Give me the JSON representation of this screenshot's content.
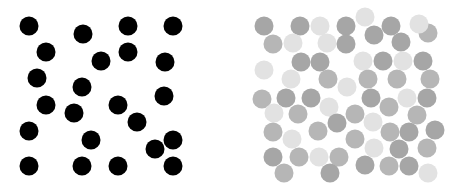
{
  "figure": {
    "width": 461,
    "height": 190,
    "background": "#ffffff",
    "panels": [
      {
        "id": "left",
        "description": "black dots on white",
        "radius": 9.5,
        "dots": [
          {
            "x": 29,
            "y": 26,
            "c": "#000000"
          },
          {
            "x": 83,
            "y": 34,
            "c": "#000000"
          },
          {
            "x": 128,
            "y": 26,
            "c": "#000000"
          },
          {
            "x": 173,
            "y": 26,
            "c": "#000000"
          },
          {
            "x": 46,
            "y": 52,
            "c": "#000000"
          },
          {
            "x": 101,
            "y": 61,
            "c": "#000000"
          },
          {
            "x": 128,
            "y": 52,
            "c": "#000000"
          },
          {
            "x": 165,
            "y": 62,
            "c": "#000000"
          },
          {
            "x": 37,
            "y": 78,
            "c": "#000000"
          },
          {
            "x": 82,
            "y": 87,
            "c": "#000000"
          },
          {
            "x": 164,
            "y": 96,
            "c": "#000000"
          },
          {
            "x": 46,
            "y": 105,
            "c": "#000000"
          },
          {
            "x": 74,
            "y": 113,
            "c": "#000000"
          },
          {
            "x": 118,
            "y": 105,
            "c": "#000000"
          },
          {
            "x": 137,
            "y": 122,
            "c": "#000000"
          },
          {
            "x": 29,
            "y": 131,
            "c": "#000000"
          },
          {
            "x": 91,
            "y": 140,
            "c": "#000000"
          },
          {
            "x": 173,
            "y": 140,
            "c": "#000000"
          },
          {
            "x": 155,
            "y": 149,
            "c": "#000000"
          },
          {
            "x": 29,
            "y": 166,
            "c": "#000000"
          },
          {
            "x": 82,
            "y": 166,
            "c": "#000000"
          },
          {
            "x": 118,
            "y": 166,
            "c": "#000000"
          },
          {
            "x": 173,
            "y": 166,
            "c": "#000000"
          }
        ]
      },
      {
        "id": "right",
        "description": "gray dots of varying lightness on white",
        "radius": 9.5,
        "colors": {
          "dark": "#a6a6a6",
          "mid": "#b6b6b6",
          "light": "#e2e2e2"
        },
        "dots": [
          {
            "x": 34,
            "y": 26,
            "t": "dark"
          },
          {
            "x": 70,
            "y": 26,
            "t": "dark"
          },
          {
            "x": 90,
            "y": 26,
            "t": "light"
          },
          {
            "x": 116,
            "y": 26,
            "t": "dark"
          },
          {
            "x": 135,
            "y": 17,
            "t": "light"
          },
          {
            "x": 161,
            "y": 26,
            "t": "dark"
          },
          {
            "x": 198,
            "y": 33,
            "t": "mid"
          },
          {
            "x": 189,
            "y": 24,
            "t": "light"
          },
          {
            "x": 43,
            "y": 44,
            "t": "mid"
          },
          {
            "x": 63,
            "y": 43,
            "t": "light"
          },
          {
            "x": 97,
            "y": 43,
            "t": "light"
          },
          {
            "x": 116,
            "y": 44,
            "t": "dark"
          },
          {
            "x": 144,
            "y": 35,
            "t": "dark"
          },
          {
            "x": 171,
            "y": 42,
            "t": "dark"
          },
          {
            "x": 34,
            "y": 70,
            "t": "light"
          },
          {
            "x": 71,
            "y": 62,
            "t": "dark"
          },
          {
            "x": 90,
            "y": 62,
            "t": "dark"
          },
          {
            "x": 133,
            "y": 61,
            "t": "light"
          },
          {
            "x": 153,
            "y": 61,
            "t": "dark"
          },
          {
            "x": 173,
            "y": 61,
            "t": "light"
          },
          {
            "x": 193,
            "y": 61,
            "t": "dark"
          },
          {
            "x": 61,
            "y": 79,
            "t": "light"
          },
          {
            "x": 98,
            "y": 79,
            "t": "mid"
          },
          {
            "x": 117,
            "y": 87,
            "t": "light"
          },
          {
            "x": 138,
            "y": 79,
            "t": "mid"
          },
          {
            "x": 167,
            "y": 79,
            "t": "mid"
          },
          {
            "x": 200,
            "y": 79,
            "t": "mid"
          },
          {
            "x": 32,
            "y": 99,
            "t": "mid"
          },
          {
            "x": 56,
            "y": 98,
            "t": "dark"
          },
          {
            "x": 81,
            "y": 98,
            "t": "dark"
          },
          {
            "x": 99,
            "y": 107,
            "t": "light"
          },
          {
            "x": 141,
            "y": 98,
            "t": "dark"
          },
          {
            "x": 159,
            "y": 107,
            "t": "mid"
          },
          {
            "x": 177,
            "y": 98,
            "t": "light"
          },
          {
            "x": 197,
            "y": 98,
            "t": "dark"
          },
          {
            "x": 44,
            "y": 113,
            "t": "light"
          },
          {
            "x": 68,
            "y": 114,
            "t": "mid"
          },
          {
            "x": 107,
            "y": 123,
            "t": "dark"
          },
          {
            "x": 125,
            "y": 114,
            "t": "mid"
          },
          {
            "x": 143,
            "y": 122,
            "t": "light"
          },
          {
            "x": 187,
            "y": 115,
            "t": "mid"
          },
          {
            "x": 43,
            "y": 132,
            "t": "mid"
          },
          {
            "x": 62,
            "y": 139,
            "t": "light"
          },
          {
            "x": 88,
            "y": 131,
            "t": "mid"
          },
          {
            "x": 125,
            "y": 139,
            "t": "mid"
          },
          {
            "x": 160,
            "y": 132,
            "t": "mid"
          },
          {
            "x": 179,
            "y": 132,
            "t": "dark"
          },
          {
            "x": 205,
            "y": 130,
            "t": "dark"
          },
          {
            "x": 43,
            "y": 157,
            "t": "dark"
          },
          {
            "x": 69,
            "y": 157,
            "t": "mid"
          },
          {
            "x": 89,
            "y": 157,
            "t": "light"
          },
          {
            "x": 109,
            "y": 157,
            "t": "mid"
          },
          {
            "x": 144,
            "y": 148,
            "t": "light"
          },
          {
            "x": 169,
            "y": 149,
            "t": "dark"
          },
          {
            "x": 197,
            "y": 148,
            "t": "mid"
          },
          {
            "x": 54,
            "y": 173,
            "t": "mid"
          },
          {
            "x": 100,
            "y": 173,
            "t": "dark"
          },
          {
            "x": 135,
            "y": 165,
            "t": "dark"
          },
          {
            "x": 159,
            "y": 166,
            "t": "mid"
          },
          {
            "x": 179,
            "y": 166,
            "t": "dark"
          },
          {
            "x": 198,
            "y": 173,
            "t": "light"
          }
        ]
      }
    ]
  }
}
